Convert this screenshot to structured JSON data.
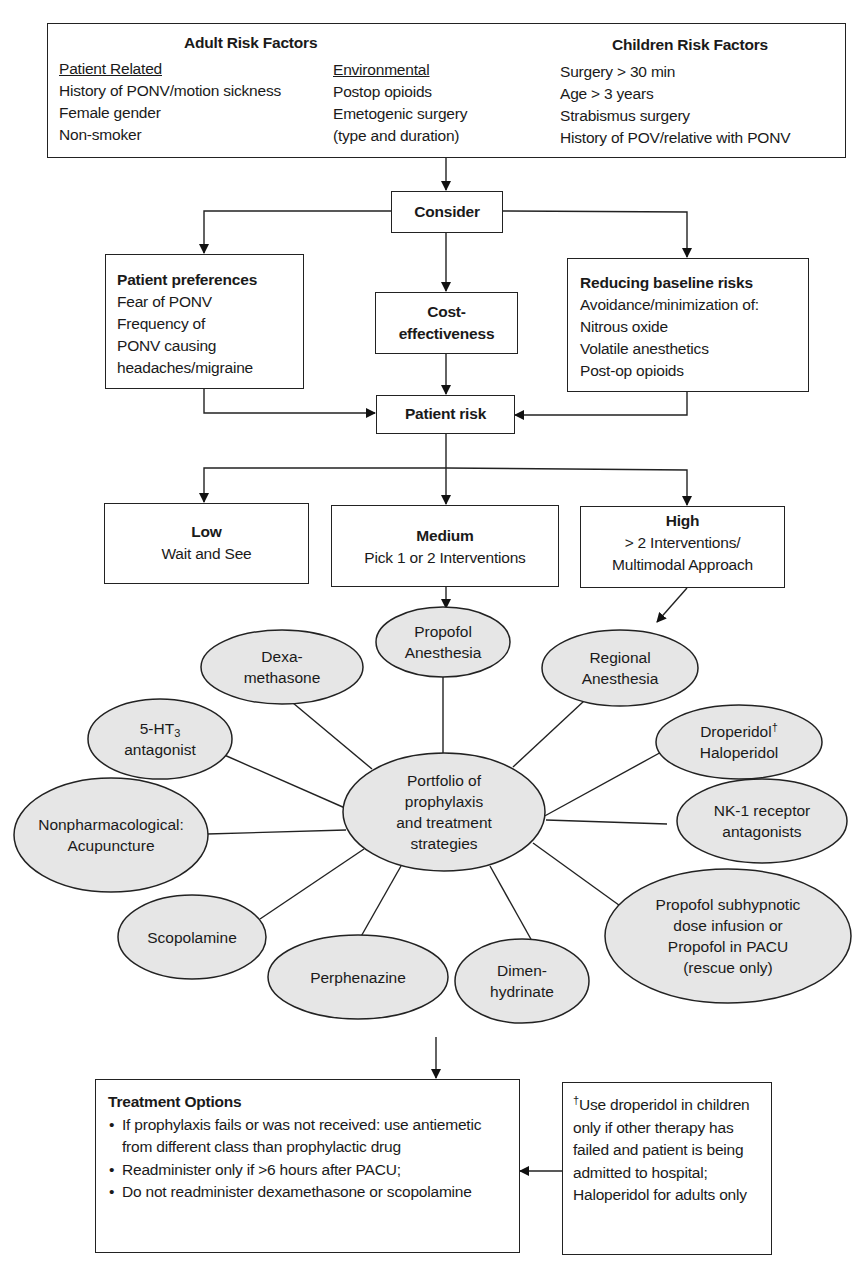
{
  "risk_factors": {
    "adult_title": "Adult Risk Factors",
    "children_title": "Children Risk Factors",
    "patient_related": {
      "heading": "Patient Related",
      "items": [
        "History of PONV/motion sickness",
        "Female gender",
        "Non-smoker"
      ]
    },
    "environmental": {
      "heading": "Environmental",
      "items": [
        "Postop opioids",
        "Emetogenic surgery",
        "(type and duration)"
      ]
    },
    "children": {
      "items": [
        "Surgery > 30 min",
        "Age > 3 years",
        "Strabismus surgery",
        "History of POV/relative with PONV"
      ]
    }
  },
  "consider": {
    "label": "Consider"
  },
  "patient_preferences": {
    "title": "Patient preferences",
    "lines": [
      "Fear of PONV",
      "Frequency of",
      "PONV causing",
      "headaches/migraine"
    ]
  },
  "cost_effectiveness": {
    "line1": "Cost-",
    "line2": "effectiveness"
  },
  "reducing_risks": {
    "title": "Reducing baseline risks",
    "lines": [
      "Avoidance/minimization of:",
      "Nitrous oxide",
      "Volatile anesthetics",
      "Post-op opioids"
    ]
  },
  "patient_risk": {
    "label": "Patient risk"
  },
  "risk_levels": {
    "low": {
      "title": "Low",
      "lines": [
        "Wait and See"
      ]
    },
    "medium": {
      "title": "Medium",
      "lines": [
        "Pick 1 or 2 Interventions"
      ]
    },
    "high": {
      "title": "High",
      "lines": [
        "> 2 Interventions/",
        "Multimodal Approach"
      ]
    }
  },
  "portfolio": {
    "center": [
      "Portfolio of",
      "prophylaxis",
      "and treatment",
      "strategies"
    ],
    "nodes": {
      "propofol_anesthesia": [
        "Propofol",
        "Anesthesia"
      ],
      "dexamethasone": [
        "Dexa-",
        "methasone"
      ],
      "regional_anesthesia": [
        "Regional",
        "Anesthesia"
      ],
      "ht3_prefix": "5-HT",
      "ht3_sub": "3",
      "ht3_line2": "antagonist",
      "droperidol": "Droperidol",
      "droperidol_mark": "†",
      "haloperidol": "Haloperidol",
      "nonpharm": [
        "Nonpharmacological:",
        "Acupuncture"
      ],
      "nk1": [
        "NK-1 receptor",
        "antagonists"
      ],
      "scopolamine": [
        "Scopolamine"
      ],
      "perphenazine": [
        "Perphenazine"
      ],
      "dimenhydrinate": [
        "Dimen-",
        "hydrinate"
      ],
      "propofol_subhypnotic": [
        "Propofol subhypnotic",
        "dose infusion or",
        "Propofol in PACU",
        "(rescue only)"
      ]
    }
  },
  "treatment_options": {
    "title": "Treatment Options",
    "bullets": [
      "If prophylaxis fails or was not received: use antiemetic from different class than prophylactic drug",
      "Readminister only if >6 hours after PACU;",
      "Do not readminister dexamethasone or scopolamine"
    ]
  },
  "footnote": {
    "mark": "†",
    "text": "Use droperidol in children only if other therapy has failed and patient is being admitted to hospital; Haloperidol for adults only"
  },
  "colors": {
    "ellipse_fill": "#e6e6e6",
    "line": "#222222"
  }
}
